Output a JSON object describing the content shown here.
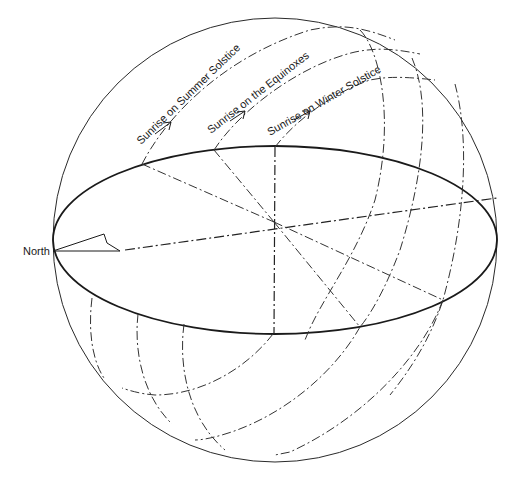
{
  "diagram": {
    "direction_label": "North",
    "paths": [
      {
        "id": "summer",
        "label": "Sunrise on Summer Solstice"
      },
      {
        "id": "equinox",
        "label": "Sunrise on the Equinoxes"
      },
      {
        "id": "winter",
        "label": "Sunrise on Winter Solstice"
      }
    ],
    "colors": {
      "line": "#1a1a1a",
      "background": "#ffffff"
    }
  }
}
